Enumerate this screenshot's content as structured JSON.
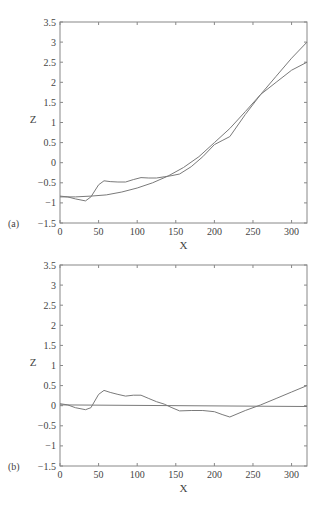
{
  "chart_data": [
    {
      "type": "line",
      "panel_label": "(a)",
      "title": "",
      "xlabel": "X",
      "ylabel": "Z",
      "xlim": [
        0,
        320
      ],
      "ylim": [
        -1.5,
        3.5
      ],
      "xticks": [
        0,
        50,
        100,
        150,
        200,
        250,
        300
      ],
      "xtick_labels": [
        "0",
        "50",
        "100",
        "150",
        "200",
        "250",
        "300"
      ],
      "yticks": [
        -1.5,
        -1,
        -0.5,
        0,
        0.5,
        1,
        1.5,
        2,
        2.5,
        3,
        3.5
      ],
      "ytick_labels": [
        "−1.5",
        "−1",
        "−0.5",
        "0",
        "0.5",
        "1",
        "1.5",
        "2",
        "2.5",
        "3",
        "3.5"
      ],
      "grid": false,
      "legend": null,
      "series": [
        {
          "name": "fitted curve",
          "x": [
            0,
            20,
            40,
            60,
            80,
            100,
            120,
            140,
            160,
            180,
            200,
            220,
            240,
            260,
            280,
            300,
            320
          ],
          "y": [
            -0.85,
            -0.85,
            -0.83,
            -0.8,
            -0.73,
            -0.63,
            -0.5,
            -0.33,
            -0.12,
            0.15,
            0.5,
            0.85,
            1.27,
            1.7,
            2.15,
            2.6,
            3.0
          ]
        },
        {
          "name": "measured profile",
          "x": [
            0,
            10,
            20,
            33,
            40,
            50,
            57,
            65,
            75,
            85,
            95,
            105,
            115,
            125,
            135,
            145,
            155,
            170,
            185,
            200,
            210,
            220,
            240,
            260,
            280,
            300,
            320
          ],
          "y": [
            -0.83,
            -0.85,
            -0.9,
            -0.95,
            -0.85,
            -0.55,
            -0.45,
            -0.47,
            -0.48,
            -0.48,
            -0.42,
            -0.37,
            -0.38,
            -0.38,
            -0.35,
            -0.32,
            -0.28,
            -0.1,
            0.15,
            0.45,
            0.55,
            0.65,
            1.2,
            1.7,
            2.0,
            2.3,
            2.5
          ]
        }
      ]
    },
    {
      "type": "line",
      "panel_label": "(b)",
      "title": "",
      "xlabel": "X",
      "ylabel": "Z",
      "xlim": [
        0,
        320
      ],
      "ylim": [
        -1.5,
        3.5
      ],
      "xticks": [
        0,
        50,
        100,
        150,
        200,
        250,
        300
      ],
      "xtick_labels": [
        "0",
        "50",
        "100",
        "150",
        "200",
        "250",
        "300"
      ],
      "yticks": [
        -1.5,
        -1,
        -0.5,
        0,
        0.5,
        1,
        1.5,
        2,
        2.5,
        3,
        3.5
      ],
      "ytick_labels": [
        "−1.5",
        "−1",
        "−0.5",
        "0",
        "0.5",
        "1",
        "1.5",
        "2",
        "2.5",
        "3",
        "3.5"
      ],
      "grid": false,
      "legend": null,
      "series": [
        {
          "name": "zero line",
          "x": [
            0,
            320
          ],
          "y": [
            0.02,
            -0.02
          ]
        },
        {
          "name": "residual",
          "x": [
            0,
            10,
            20,
            33,
            40,
            50,
            57,
            65,
            75,
            85,
            95,
            105,
            115,
            125,
            135,
            145,
            155,
            170,
            185,
            200,
            210,
            220,
            240,
            260,
            280,
            300,
            320
          ],
          "y": [
            0.05,
            0.02,
            -0.05,
            -0.1,
            -0.05,
            0.28,
            0.38,
            0.33,
            0.28,
            0.24,
            0.26,
            0.26,
            0.18,
            0.1,
            0.04,
            -0.05,
            -0.13,
            -0.12,
            -0.12,
            -0.15,
            -0.22,
            -0.28,
            -0.12,
            0.02,
            0.18,
            0.34,
            0.5
          ]
        }
      ]
    }
  ],
  "style": {
    "line_color": "#7a7a7a",
    "axis_color": "#888888",
    "text_color": "#444444"
  }
}
